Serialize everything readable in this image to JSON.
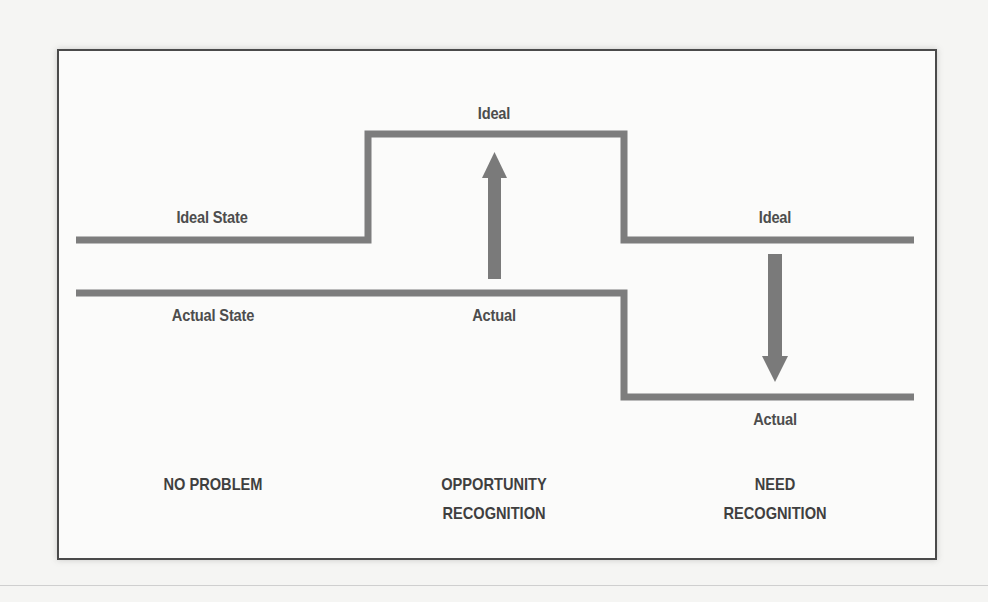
{
  "diagram": {
    "type": "problem-recognition-states",
    "colors": {
      "line": "#7d7d7d",
      "arrow": "#7a7a7a",
      "text": "#4d4d4d",
      "frame": "#4a4a4a",
      "background": "#fbfbfa"
    },
    "lines": {
      "ideal_state_label": "Ideal State",
      "actual_state_label": "Actual State"
    },
    "panels": [
      {
        "id": "no-problem",
        "ideal_label": "Ideal State",
        "actual_label": "Actual State",
        "category_lines": [
          "NO PROBLEM"
        ]
      },
      {
        "id": "opportunity-recognition",
        "ideal_label": "Ideal",
        "actual_label": "Actual",
        "arrow": "up",
        "category_lines": [
          "OPPORTUNITY",
          "RECOGNITION"
        ]
      },
      {
        "id": "need-recognition",
        "ideal_label": "Ideal",
        "actual_label": "Actual",
        "arrow": "down",
        "category_lines": [
          "NEED",
          "RECOGNITION"
        ]
      }
    ]
  }
}
